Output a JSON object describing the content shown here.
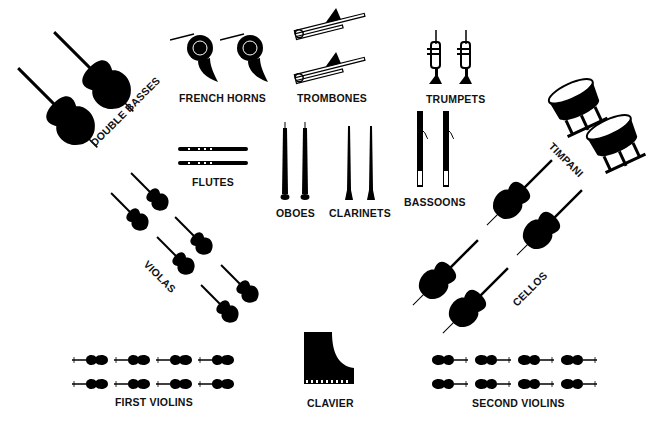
{
  "diagram": {
    "type": "orchestra-seating-chart",
    "sections": [
      {
        "id": "double_basses",
        "label": "DOUBLE BASSES",
        "count": 2
      },
      {
        "id": "french_horns",
        "label": "FRENCH HORNS",
        "count": 2
      },
      {
        "id": "trombones",
        "label": "TROMBONES",
        "count": 2
      },
      {
        "id": "trumpets",
        "label": "TRUMPETS",
        "count": 2
      },
      {
        "id": "timpani",
        "label": "TIMPANI",
        "count": 2
      },
      {
        "id": "flutes",
        "label": "FLUTES",
        "count": 2
      },
      {
        "id": "oboes",
        "label": "OBOES",
        "count": 2
      },
      {
        "id": "clarinets",
        "label": "CLARINETS",
        "count": 2
      },
      {
        "id": "bassoons",
        "label": "BASSOONS",
        "count": 2
      },
      {
        "id": "violas",
        "label": "VIOLAS",
        "count": 6
      },
      {
        "id": "cellos",
        "label": "CELLOS",
        "count": 4
      },
      {
        "id": "first_violins",
        "label": "FIRST VIOLINS",
        "count": 8
      },
      {
        "id": "clavier",
        "label": "CLAVIER",
        "count": 1
      },
      {
        "id": "second_violins",
        "label": "SECOND VIOLINS",
        "count": 8
      }
    ]
  },
  "colors": {
    "ink": "#000000",
    "background": "#ffffff"
  }
}
